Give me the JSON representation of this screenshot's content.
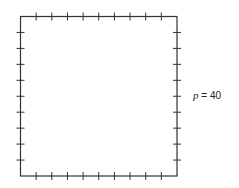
{
  "diagram": {
    "shape": "square",
    "ticks_per_side": 9,
    "stroke_color": "#333333",
    "label": {
      "variable": "p",
      "equals": " = ",
      "value": "40"
    }
  }
}
